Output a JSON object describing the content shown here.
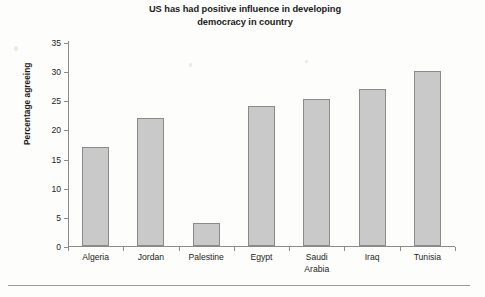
{
  "chart_data": {
    "type": "bar",
    "title": "US has had positive influence in developing democracy in country",
    "title_line1": "US has had positive influence in developing",
    "title_line2": "democracy in country",
    "xlabel": "",
    "ylabel": "Percentage agreeing",
    "categories": [
      "Algeria",
      "Jordan",
      "Palestine",
      "Egypt",
      "Saudi Arabia",
      "Iraq",
      "Tunisia"
    ],
    "values": [
      17,
      22,
      4,
      24,
      25.2,
      27,
      30.1
    ],
    "ylim": [
      0,
      35
    ],
    "yticks": [
      0,
      5,
      10,
      15,
      20,
      25,
      30,
      35
    ],
    "ytick_labels": [
      "0",
      "5",
      "10",
      "15",
      "20",
      "25",
      "30",
      "35"
    ],
    "grid": false,
    "legend": "none",
    "bar_color": "#c9c9c9",
    "bar_border_color": "#8a8a8a",
    "axis_color": "#8b8b8b"
  },
  "category_labels": [
    {
      "line1": "Algeria",
      "line2": ""
    },
    {
      "line1": "Jordan",
      "line2": ""
    },
    {
      "line1": "Palestine",
      "line2": ""
    },
    {
      "line1": "Egypt",
      "line2": ""
    },
    {
      "line1": "Saudi",
      "line2": "Arabia"
    },
    {
      "line1": "Iraq",
      "line2": ""
    },
    {
      "line1": "Tunisia",
      "line2": ""
    }
  ]
}
